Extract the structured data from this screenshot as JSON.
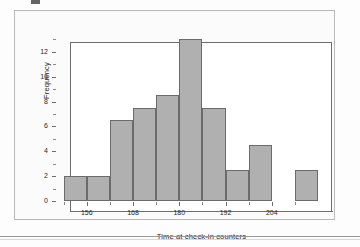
{
  "figure": {
    "background_color": "#fbfbfb",
    "frame_color": "#b9b9b9",
    "bar_fill_color": "#b0b0b0",
    "bar_edge_color": "#6b6b6b",
    "axis_color": "#6e6e6e"
  },
  "chart_data": {
    "type": "bar",
    "title": "",
    "subtitle": "",
    "xlabel": "Time at check-in counters",
    "ylabel": "Frequency",
    "categories": [
      "150-156",
      "156-162",
      "162-168",
      "168-174",
      "174-180",
      "180-186",
      "186-192",
      "192-198",
      "198-204",
      "204-210",
      "210-216"
    ],
    "bin_starts": [
      150,
      156,
      162,
      168,
      174,
      180,
      186,
      192,
      198,
      204,
      210
    ],
    "bin_width": 6,
    "values": [
      2,
      2,
      6.5,
      7.5,
      8.5,
      13,
      7.5,
      2.5,
      4.5,
      0,
      2.5
    ],
    "xlim": [
      148,
      216
    ],
    "ylim": [
      0,
      13.6
    ],
    "xticks": [
      156,
      168,
      180,
      192,
      204
    ],
    "xtick_labels": [
      "156",
      "168",
      "180",
      "192",
      "204"
    ],
    "xticks_minor": [
      150,
      162,
      174,
      186,
      198,
      210
    ],
    "yticks": [
      0,
      2,
      4,
      6,
      8,
      10,
      12
    ],
    "ytick_labels": [
      "0",
      "2",
      "4",
      "6",
      "8",
      "10",
      "12"
    ],
    "yticks_minor": [
      1,
      3,
      5,
      7,
      9,
      11,
      13
    ],
    "grid": false,
    "legend": false
  }
}
